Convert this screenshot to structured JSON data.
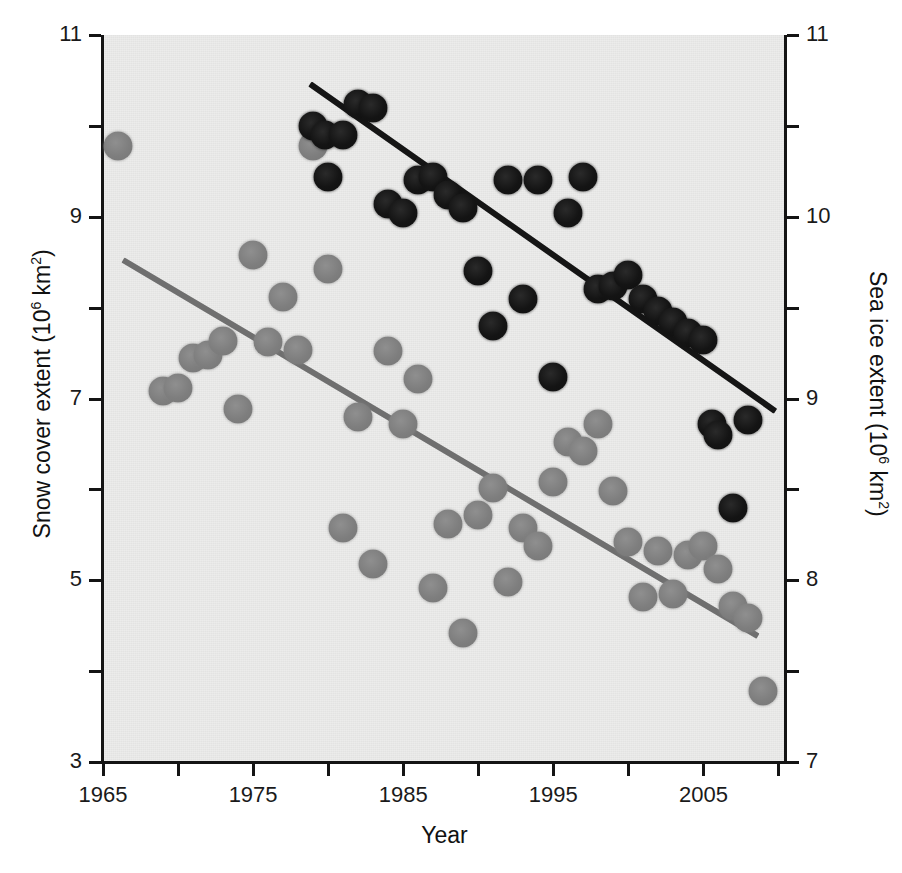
{
  "chart_data": {
    "type": "scatter",
    "title": "",
    "xlabel": "Year",
    "xlim": [
      1965,
      2010.5
    ],
    "xticks": [
      1965,
      1975,
      1985,
      1995,
      2005
    ],
    "xminorticks": [
      1970,
      1980,
      1990,
      2000,
      2010
    ],
    "grid": false,
    "legend": "none",
    "axes": [
      {
        "id": "left",
        "ylabel": "Snow cover extent (10⁶ km²)",
        "ylabel_text": "Snow cover extent (10",
        "ylabel_sup": "6",
        "ylabel_tail": " km",
        "ylabel_sup2": "2",
        "ylabel_end": ")",
        "ylim": [
          3,
          11
        ],
        "yticks": [
          3,
          5,
          7,
          9,
          11
        ],
        "yminorticks": [
          4,
          6,
          8,
          10
        ]
      },
      {
        "id": "right",
        "ylabel": "Sea ice extent (10⁶ km²)",
        "ylabel_text": "Sea ice extent (10",
        "ylabel_sup": "6",
        "ylabel_tail": " km",
        "ylabel_sup2": "2",
        "ylabel_end": ")",
        "ylim": [
          7,
          11
        ],
        "yticks": [
          7,
          8,
          9,
          10,
          11
        ],
        "yminorticks": [
          7.5,
          8.5,
          9.5,
          10.5
        ]
      }
    ],
    "series": [
      {
        "name": "Snow cover extent",
        "axis": "left",
        "color": "#7e7e7e",
        "marker": "circle",
        "points": [
          {
            "x": 1966,
            "y": 9.78
          },
          {
            "x": 1969,
            "y": 7.08
          },
          {
            "x": 1970,
            "y": 7.12
          },
          {
            "x": 1971,
            "y": 7.45
          },
          {
            "x": 1972,
            "y": 7.48
          },
          {
            "x": 1973,
            "y": 7.63
          },
          {
            "x": 1974,
            "y": 6.88
          },
          {
            "x": 1975,
            "y": 8.58
          },
          {
            "x": 1976,
            "y": 7.62
          },
          {
            "x": 1977,
            "y": 8.12
          },
          {
            "x": 1978,
            "y": 7.53
          },
          {
            "x": 1979,
            "y": 9.78
          },
          {
            "x": 1980,
            "y": 8.42
          },
          {
            "x": 1981,
            "y": 5.58
          },
          {
            "x": 1982,
            "y": 6.8
          },
          {
            "x": 1983,
            "y": 5.18
          },
          {
            "x": 1984,
            "y": 7.52
          },
          {
            "x": 1985,
            "y": 6.72
          },
          {
            "x": 1986,
            "y": 7.22
          },
          {
            "x": 1987,
            "y": 4.92
          },
          {
            "x": 1988,
            "y": 5.62
          },
          {
            "x": 1989,
            "y": 4.42
          },
          {
            "x": 1990,
            "y": 5.72
          },
          {
            "x": 1991,
            "y": 6.02
          },
          {
            "x": 1992,
            "y": 4.98
          },
          {
            "x": 1993,
            "y": 5.58
          },
          {
            "x": 1994,
            "y": 5.38
          },
          {
            "x": 1995,
            "y": 6.08
          },
          {
            "x": 1996,
            "y": 6.52
          },
          {
            "x": 1997,
            "y": 6.42
          },
          {
            "x": 1998,
            "y": 6.72
          },
          {
            "x": 1999,
            "y": 5.98
          },
          {
            "x": 2000,
            "y": 5.42
          },
          {
            "x": 2001,
            "y": 4.82
          },
          {
            "x": 2002,
            "y": 5.32
          },
          {
            "x": 2003,
            "y": 4.85
          },
          {
            "x": 2004,
            "y": 5.28
          },
          {
            "x": 2005,
            "y": 5.38
          },
          {
            "x": 2006,
            "y": 5.12
          },
          {
            "x": 2007,
            "y": 4.72
          },
          {
            "x": 2008,
            "y": 4.58
          },
          {
            "x": 2009,
            "y": 3.78
          }
        ]
      },
      {
        "name": "Sea ice extent",
        "axis": "right",
        "color": "#141414",
        "marker": "circle",
        "points": [
          {
            "x": 1979,
            "y": 10.5
          },
          {
            "x": 1979.8,
            "y": 10.45
          },
          {
            "x": 1980,
            "y": 10.22
          },
          {
            "x": 1981,
            "y": 10.45
          },
          {
            "x": 1982,
            "y": 10.62
          },
          {
            "x": 1983,
            "y": 10.6
          },
          {
            "x": 1984,
            "y": 10.07
          },
          {
            "x": 1985,
            "y": 10.02
          },
          {
            "x": 1986,
            "y": 10.2
          },
          {
            "x": 1987,
            "y": 10.22
          },
          {
            "x": 1988,
            "y": 10.12
          },
          {
            "x": 1989,
            "y": 10.05
          },
          {
            "x": 1990,
            "y": 9.7
          },
          {
            "x": 1991,
            "y": 9.4
          },
          {
            "x": 1992,
            "y": 10.2
          },
          {
            "x": 1993,
            "y": 9.55
          },
          {
            "x": 1994,
            "y": 10.2
          },
          {
            "x": 1995,
            "y": 9.12
          },
          {
            "x": 1996,
            "y": 10.02
          },
          {
            "x": 1997,
            "y": 10.22
          },
          {
            "x": 1998,
            "y": 9.6
          },
          {
            "x": 1999,
            "y": 9.62
          },
          {
            "x": 2000,
            "y": 9.68
          },
          {
            "x": 2001,
            "y": 9.55
          },
          {
            "x": 2002,
            "y": 9.48
          },
          {
            "x": 2003,
            "y": 9.42
          },
          {
            "x": 2004,
            "y": 9.36
          },
          {
            "x": 2005,
            "y": 9.32
          },
          {
            "x": 2005.6,
            "y": 8.86
          },
          {
            "x": 2006,
            "y": 8.8
          },
          {
            "x": 2007,
            "y": 8.4
          },
          {
            "x": 2008,
            "y": 8.88
          }
        ]
      }
    ],
    "trendlines": [
      {
        "name": "Snow cover trend",
        "axis": "left",
        "color": "#6f6f6f",
        "x0": 1966.3,
        "y0": 8.52,
        "x1": 2008.6,
        "y1": 4.38
      },
      {
        "name": "Sea ice trend",
        "axis": "right",
        "color": "#151515",
        "x0": 1978.8,
        "y0": 10.73,
        "x1": 2009.8,
        "y1": 8.93
      }
    ]
  }
}
